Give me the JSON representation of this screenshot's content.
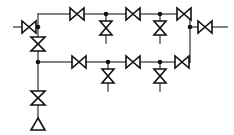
{
  "diagram": {
    "type": "p-and-id",
    "canvas": {
      "width": 234,
      "height": 135,
      "background": "#ffffff"
    },
    "colors": {
      "pipe": "#555a5e",
      "symbol_outline": "#101214",
      "symbol_fill": "#ffffff",
      "junction": "#101214"
    },
    "geometry": {
      "top_header_y": 14,
      "inlet_y": 27,
      "bottom_header_y": 62,
      "left_trunk_x": 38,
      "right_riser_x": 190,
      "vent_y": 125
    },
    "labels": {
      "inlet": "inlet",
      "outlet": "outlet",
      "vent": "vent-to-atmosphere",
      "top_header": "top-header",
      "bottom_header": "bottom-header",
      "left_trunk": "left-trunk",
      "right_riser": "right-riser"
    },
    "symbol_legend": {
      "bowtie": "gate-valve-horizontal",
      "hourglass": "gate-valve-vertical",
      "triangle": "vent-discharge"
    },
    "counts": {
      "horizontal_valves": 8,
      "vertical_valves": 6,
      "junctions": 8,
      "vents": 1
    },
    "nodes": {
      "inlet_stub": {
        "x1": 13,
        "x2": 22,
        "y": 27
      },
      "outlet_stub": {
        "x1": 212,
        "x2": 228,
        "y": 27
      }
    },
    "valves": {
      "inlet_valve": {
        "cx": 29,
        "cy": 27,
        "orient": "h",
        "name": "inlet-gate-valve"
      },
      "outlet_valve": {
        "cx": 205,
        "cy": 27,
        "orient": "h",
        "name": "outlet-gate-valve"
      },
      "top_line": [
        {
          "cx": 77,
          "cy": 14,
          "orient": "h",
          "name": "top-valve-1"
        },
        {
          "cx": 133,
          "cy": 14,
          "orient": "h",
          "name": "top-valve-2"
        },
        {
          "cx": 184,
          "cy": 14,
          "orient": "h",
          "name": "top-valve-3"
        }
      ],
      "top_branches": [
        {
          "cx": 106,
          "cy": 28,
          "orient": "v",
          "name": "top-branch-valve-1",
          "stem_to": 42
        },
        {
          "cx": 160,
          "cy": 28,
          "orient": "v",
          "name": "top-branch-valve-2",
          "stem_to": 42
        }
      ],
      "bottom_line": [
        {
          "cx": 79,
          "cy": 62,
          "orient": "h",
          "name": "bottom-valve-1"
        },
        {
          "cx": 133,
          "cy": 62,
          "orient": "h",
          "name": "bottom-valve-2"
        },
        {
          "cx": 182,
          "cy": 62,
          "orient": "h",
          "name": "bottom-valve-3"
        }
      ],
      "bottom_branches": [
        {
          "cx": 108,
          "cy": 76,
          "orient": "v",
          "name": "bottom-branch-valve-1",
          "stem_to": 90
        },
        {
          "cx": 160,
          "cy": 76,
          "orient": "v",
          "name": "bottom-branch-valve-2",
          "stem_to": 90
        }
      ],
      "trunk": [
        {
          "cx": 38,
          "cy": 44,
          "orient": "v",
          "name": "trunk-upper-valve"
        },
        {
          "cx": 38,
          "cy": 98,
          "orient": "v",
          "name": "trunk-lower-valve"
        }
      ]
    },
    "junction_points": [
      {
        "x": 38,
        "y": 27,
        "name": "junction-inlet-tee"
      },
      {
        "x": 38,
        "y": 62,
        "name": "junction-bottom-tee"
      },
      {
        "x": 106,
        "y": 14,
        "name": "junction-top-branch-1"
      },
      {
        "x": 160,
        "y": 14,
        "name": "junction-top-branch-2"
      },
      {
        "x": 108,
        "y": 62,
        "name": "junction-bottom-branch-1"
      },
      {
        "x": 160,
        "y": 62,
        "name": "junction-bottom-branch-2"
      },
      {
        "x": 190,
        "y": 27,
        "name": "junction-outlet-tee"
      }
    ],
    "vent": {
      "cx": 38,
      "cy": 125,
      "name": "vent-discharge-triangle"
    }
  }
}
